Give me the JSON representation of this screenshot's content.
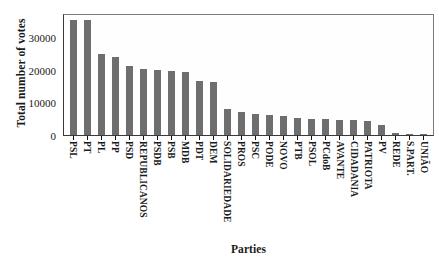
{
  "chart_data": {
    "type": "bar",
    "title": "",
    "xlabel": "Parties",
    "ylabel": "Total number of votes",
    "categories": [
      "PSL",
      "PT",
      "PL",
      "PP",
      "PSD",
      "REPUBLICANOS",
      "PSDB",
      "PSB",
      "MDB",
      "PDT",
      "DEM",
      "SOLIDARIEDADE",
      "PROS",
      "PSC",
      "PODE",
      "NOVO",
      "PTB",
      "PSOL",
      "PCdoB",
      "AVANTE",
      "CIDADANIA",
      "PATRIOTA",
      "PV",
      "REDE",
      "S.PART.",
      "UNIÃO"
    ],
    "values": [
      35500,
      35300,
      24800,
      24100,
      21200,
      20400,
      20000,
      19700,
      19300,
      16500,
      16200,
      7900,
      7100,
      6600,
      6200,
      5900,
      5300,
      5000,
      4900,
      4600,
      4600,
      4400,
      3200,
      700,
      250,
      200
    ],
    "ylim": [
      0,
      37500
    ],
    "yticks": [
      10000,
      20000,
      30000
    ],
    "ytick_labels": [
      "10000",
      "20000",
      "30000"
    ],
    "grid": false,
    "legend": "none",
    "bar_color": "#6e6e6e",
    "axis_color": "#3a3a3a",
    "background": "#ffffff"
  }
}
